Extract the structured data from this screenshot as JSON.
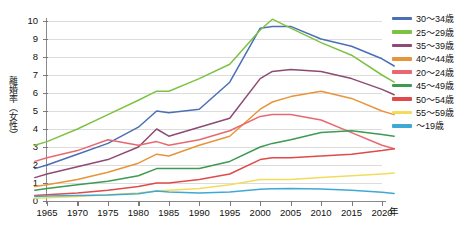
{
  "chart_data": {
    "type": "line",
    "title": "",
    "xlabel": "年",
    "ylabel": "離婚率（女性）",
    "xlim": [
      1963,
      2022
    ],
    "ylim": [
      0,
      10
    ],
    "grid": true,
    "legend_position": "right",
    "x": [
      1963,
      1965,
      1970,
      1975,
      1980,
      1983,
      1985,
      1990,
      1995,
      2000,
      2002,
      2005,
      2010,
      2015,
      2020,
      2022
    ],
    "xticks": [
      1965,
      1970,
      1975,
      1980,
      1985,
      1990,
      1995,
      2000,
      2005,
      2010,
      2015,
      2020
    ],
    "yticks": [
      0,
      1,
      2,
      3,
      4,
      5,
      6,
      7,
      8,
      9,
      10
    ],
    "series": [
      {
        "name": "30～34歳",
        "color": "#4a6fb5",
        "values": [
          1.8,
          2.0,
          2.6,
          3.2,
          4.1,
          5.0,
          4.9,
          5.1,
          6.6,
          9.6,
          9.7,
          9.7,
          9.0,
          8.6,
          7.9,
          7.5
        ]
      },
      {
        "name": "25～29歳",
        "color": "#7dc242",
        "values": [
          3.1,
          3.3,
          4.0,
          4.8,
          5.6,
          6.1,
          6.1,
          6.8,
          7.6,
          9.5,
          10.1,
          9.6,
          8.8,
          8.1,
          7.0,
          6.6
        ]
      },
      {
        "name": "35～39歳",
        "color": "#8e4a72",
        "values": [
          1.3,
          1.5,
          1.9,
          2.3,
          3.0,
          4.0,
          3.6,
          4.1,
          4.6,
          6.8,
          7.2,
          7.3,
          7.2,
          6.8,
          6.2,
          5.9
        ]
      },
      {
        "name": "40～44歳",
        "color": "#e8943a",
        "values": [
          0.8,
          0.9,
          1.2,
          1.6,
          2.1,
          2.6,
          2.5,
          3.1,
          3.6,
          5.1,
          5.5,
          5.8,
          6.1,
          5.7,
          5.0,
          4.8
        ]
      },
      {
        "name": "20～24歳",
        "color": "#e8686f",
        "values": [
          2.2,
          2.4,
          2.8,
          3.4,
          3.1,
          3.3,
          3.1,
          3.4,
          3.9,
          4.7,
          4.8,
          4.8,
          4.5,
          3.8,
          3.1,
          2.9
        ]
      },
      {
        "name": "45～49歳",
        "color": "#3c9a52",
        "values": [
          0.6,
          0.7,
          0.9,
          1.1,
          1.4,
          1.8,
          1.8,
          1.8,
          2.2,
          3.0,
          3.2,
          3.4,
          3.8,
          3.9,
          3.7,
          3.6
        ]
      },
      {
        "name": "50～54歳",
        "color": "#e04a4a",
        "values": [
          0.3,
          0.35,
          0.45,
          0.6,
          0.8,
          1.0,
          1.0,
          1.2,
          1.5,
          2.3,
          2.4,
          2.4,
          2.5,
          2.6,
          2.8,
          2.9
        ]
      },
      {
        "name": "55～59歳",
        "color": "#f2dc5c",
        "values": [
          0.15,
          0.18,
          0.25,
          0.35,
          0.45,
          0.55,
          0.6,
          0.7,
          0.9,
          1.2,
          1.2,
          1.2,
          1.3,
          1.4,
          1.5,
          1.55
        ]
      },
      {
        "name": "～19歳",
        "color": "#3fa9d6",
        "values": [
          0.25,
          0.28,
          0.3,
          0.33,
          0.4,
          0.55,
          0.5,
          0.45,
          0.5,
          0.65,
          0.68,
          0.7,
          0.66,
          0.6,
          0.48,
          0.42
        ]
      }
    ]
  },
  "axes": {
    "y_title": "離婚率（女性）",
    "x_title": "年",
    "ytick_labels": [
      "10",
      "9",
      "8",
      "7",
      "6",
      "5",
      "4",
      "3",
      "2",
      "1",
      "0"
    ],
    "xtick_labels": [
      "1965",
      "1970",
      "1975",
      "1980",
      "1985",
      "1990",
      "1995",
      "2000",
      "2005",
      "2010",
      "2015",
      "2020"
    ]
  }
}
